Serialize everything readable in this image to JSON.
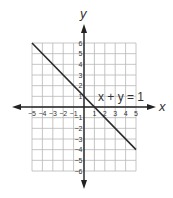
{
  "chart_data": {
    "type": "line",
    "title": "",
    "xlabel": "x",
    "ylabel": "y",
    "xlim": [
      -5,
      5
    ],
    "ylim": [
      -6,
      6
    ],
    "grid": true,
    "x_ticks": [
      "-5",
      "-4",
      "-3",
      "-2",
      "-1",
      "1",
      "2",
      "3",
      "4",
      "5"
    ],
    "y_ticks": [
      "6",
      "5",
      "4",
      "3",
      "2",
      "1",
      "-1",
      "-2",
      "-3",
      "-4",
      "-5",
      "-6"
    ],
    "series": [
      {
        "name": "x + y = 1",
        "x": [
          -5,
          5
        ],
        "y": [
          6,
          -4
        ]
      }
    ],
    "annotations": [
      {
        "text": "x + y = 1",
        "x": 1.2,
        "y": 1.2
      }
    ],
    "colors": {
      "line": "#2b2b2b",
      "grid": "#b8b8b8",
      "axis": "#222222"
    }
  }
}
